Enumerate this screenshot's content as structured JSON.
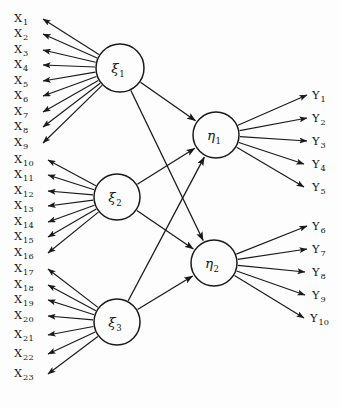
{
  "diagram": {
    "type": "sem-path-diagram",
    "title": "",
    "background_color": "#fdfdfd",
    "line_color": "#1a1a1a",
    "width": 340,
    "height": 409
  },
  "latent_variables": {
    "exogenous": [
      {
        "id": "xi1",
        "symbol": "ξ",
        "subscript": "1",
        "cx": 120,
        "cy": 68,
        "r": 24
      },
      {
        "id": "xi2",
        "symbol": "ξ",
        "subscript": "2",
        "cx": 117,
        "cy": 197,
        "r": 23
      },
      {
        "id": "xi3",
        "symbol": "ξ",
        "subscript": "3",
        "cx": 117,
        "cy": 322,
        "r": 23
      }
    ],
    "endogenous": [
      {
        "id": "eta1",
        "symbol": "η",
        "subscript": "1",
        "cx": 216,
        "cy": 135,
        "r": 23
      },
      {
        "id": "eta2",
        "symbol": "η",
        "subscript": "2",
        "cx": 214,
        "cy": 263,
        "r": 23
      }
    ]
  },
  "x_indicators": [
    {
      "label": "X",
      "subscript": "1",
      "x": 14,
      "y": 22,
      "tip_x": 43,
      "tip_y": 19
    },
    {
      "label": "X",
      "subscript": "2",
      "x": 14,
      "y": 37,
      "tip_x": 43,
      "tip_y": 34
    },
    {
      "label": "X",
      "subscript": "3",
      "x": 14,
      "y": 53,
      "tip_x": 43,
      "tip_y": 50
    },
    {
      "label": "X",
      "subscript": "4",
      "x": 14,
      "y": 68,
      "tip_x": 43,
      "tip_y": 65
    },
    {
      "label": "X",
      "subscript": "5",
      "x": 14,
      "y": 84,
      "tip_x": 43,
      "tip_y": 81
    },
    {
      "label": "X",
      "subscript": "6",
      "x": 14,
      "y": 99,
      "tip_x": 43,
      "tip_y": 96
    },
    {
      "label": "X",
      "subscript": "7",
      "x": 14,
      "y": 115,
      "tip_x": 43,
      "tip_y": 112
    },
    {
      "label": "X",
      "subscript": "8",
      "x": 14,
      "y": 130,
      "tip_x": 43,
      "tip_y": 127
    },
    {
      "label": "X",
      "subscript": "9",
      "x": 14,
      "y": 146,
      "tip_x": 43,
      "tip_y": 143
    },
    {
      "label": "X",
      "subscript": "10",
      "x": 14,
      "y": 163,
      "tip_x": 48,
      "tip_y": 160
    },
    {
      "label": "X",
      "subscript": "11",
      "x": 14,
      "y": 178,
      "tip_x": 48,
      "tip_y": 175
    },
    {
      "label": "X",
      "subscript": "12",
      "x": 14,
      "y": 194,
      "tip_x": 48,
      "tip_y": 191
    },
    {
      "label": "X",
      "subscript": "13",
      "x": 14,
      "y": 209,
      "tip_x": 48,
      "tip_y": 206
    },
    {
      "label": "X",
      "subscript": "14",
      "x": 14,
      "y": 225,
      "tip_x": 48,
      "tip_y": 222
    },
    {
      "label": "X",
      "subscript": "15",
      "x": 14,
      "y": 240,
      "tip_x": 48,
      "tip_y": 237
    },
    {
      "label": "X",
      "subscript": "16",
      "x": 14,
      "y": 256,
      "tip_x": 48,
      "tip_y": 253
    },
    {
      "label": "X",
      "subscript": "17",
      "x": 14,
      "y": 272,
      "tip_x": 48,
      "tip_y": 269
    },
    {
      "label": "X",
      "subscript": "18",
      "x": 14,
      "y": 288,
      "tip_x": 48,
      "tip_y": 285
    },
    {
      "label": "X",
      "subscript": "19",
      "x": 14,
      "y": 303,
      "tip_x": 48,
      "tip_y": 300
    },
    {
      "label": "X",
      "subscript": "20",
      "x": 14,
      "y": 319,
      "tip_x": 48,
      "tip_y": 316
    },
    {
      "label": "X",
      "subscript": "21",
      "x": 14,
      "y": 338,
      "tip_x": 48,
      "tip_y": 335
    },
    {
      "label": "X",
      "subscript": "22",
      "x": 14,
      "y": 357,
      "tip_x": 48,
      "tip_y": 354
    },
    {
      "label": "X",
      "subscript": "23",
      "x": 14,
      "y": 377,
      "tip_x": 48,
      "tip_y": 374
    }
  ],
  "y_indicators": [
    {
      "label": "Y",
      "subscript": "1",
      "x": 312,
      "y": 99,
      "tip_x": 307,
      "tip_y": 95
    },
    {
      "label": "Y",
      "subscript": "2",
      "x": 312,
      "y": 122,
      "tip_x": 307,
      "tip_y": 118
    },
    {
      "label": "Y",
      "subscript": "3",
      "x": 312,
      "y": 145,
      "tip_x": 307,
      "tip_y": 141
    },
    {
      "label": "Y",
      "subscript": "4",
      "x": 312,
      "y": 168,
      "tip_x": 304,
      "tip_y": 164
    },
    {
      "label": "Y",
      "subscript": "5",
      "x": 312,
      "y": 191,
      "tip_x": 304,
      "tip_y": 187
    },
    {
      "label": "Y",
      "subscript": "6",
      "x": 312,
      "y": 230,
      "tip_x": 307,
      "tip_y": 226
    },
    {
      "label": "Y",
      "subscript": "7",
      "x": 312,
      "y": 253,
      "tip_x": 307,
      "tip_y": 249
    },
    {
      "label": "Y",
      "subscript": "8",
      "x": 312,
      "y": 276,
      "tip_x": 305,
      "tip_y": 272
    },
    {
      "label": "Y",
      "subscript": "9",
      "x": 312,
      "y": 299,
      "tip_x": 305,
      "tip_y": 295
    },
    {
      "label": "Y",
      "subscript": "10",
      "x": 310,
      "y": 322,
      "tip_x": 304,
      "tip_y": 318
    }
  ],
  "measurement_paths": {
    "xi1_to_x": {
      "from": "xi1",
      "to": [
        "X1",
        "X2",
        "X3",
        "X4",
        "X5",
        "X6",
        "X7",
        "X8",
        "X9"
      ],
      "direction": "reflective"
    },
    "xi2_to_x": {
      "from": "xi2",
      "to": [
        "X10",
        "X11",
        "X12",
        "X13",
        "X14",
        "X15",
        "X16"
      ],
      "direction": "reflective"
    },
    "xi3_to_x": {
      "from": "xi3",
      "to": [
        "X17",
        "X18",
        "X19",
        "X20",
        "X21",
        "X22",
        "X23"
      ],
      "direction": "reflective"
    },
    "eta1_to_y": {
      "from": "eta1",
      "to": [
        "Y1",
        "Y2",
        "Y3",
        "Y4",
        "Y5"
      ],
      "direction": "reflective"
    },
    "eta2_to_y": {
      "from": "eta2",
      "to": [
        "Y6",
        "Y7",
        "Y8",
        "Y9",
        "Y10"
      ],
      "direction": "reflective"
    }
  },
  "structural_paths": [
    {
      "id": "xi1-eta1",
      "from": "xi1",
      "to": "eta1"
    },
    {
      "id": "xi1-eta2",
      "from": "xi1",
      "to": "eta2"
    },
    {
      "id": "xi2-eta1",
      "from": "xi2",
      "to": "eta1"
    },
    {
      "id": "xi2-eta2",
      "from": "xi2",
      "to": "eta2"
    },
    {
      "id": "xi3-eta1",
      "from": "xi3",
      "to": "eta1"
    },
    {
      "id": "xi3-eta2",
      "from": "xi3",
      "to": "eta2"
    }
  ]
}
